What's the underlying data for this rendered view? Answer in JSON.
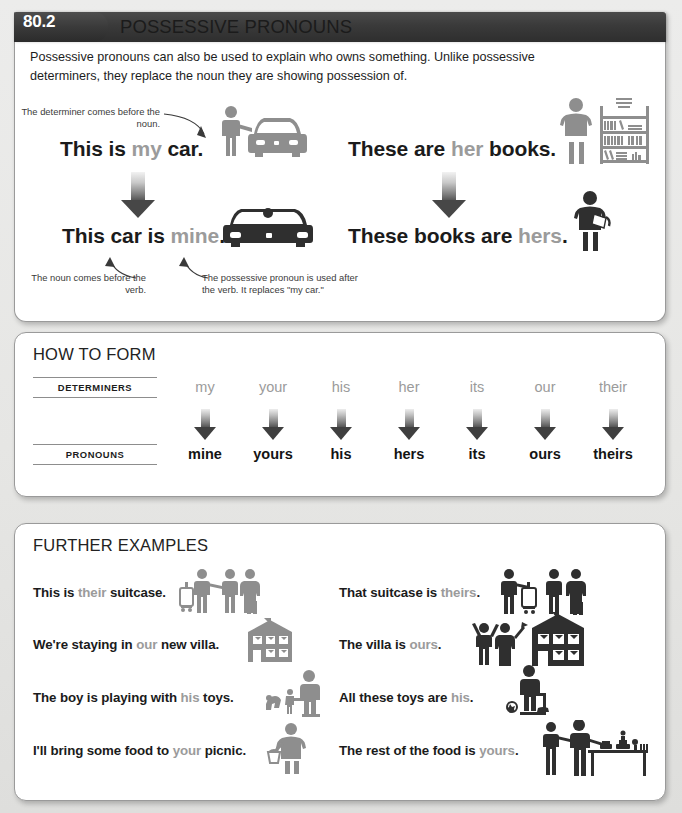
{
  "page": {
    "background_color": "#e9e9e7",
    "accent_gray": "#9b9b9b",
    "text_color": "#1b1b1b"
  },
  "header": {
    "badge": "80.2",
    "title": "POSSESSIVE PRONOUNS",
    "intro": "Possessive pronouns can also be used to explain who owns something. Unlike possessive determiners, they replace the noun they are showing possession of."
  },
  "main_examples": {
    "left": {
      "top_note": "The determiner comes before the noun.",
      "sentence_top": {
        "before": "This is ",
        "highlight": "my",
        "after": " car."
      },
      "sentence_bottom": {
        "before": "This car is ",
        "highlight": "mine",
        "after": "."
      },
      "note_left": "The noun comes before the verb.",
      "note_right": "The possessive pronoun is used after the verb. It replaces \"my car.\"",
      "icon_top": "person-with-car-icon",
      "icon_bottom": "car-icon"
    },
    "right": {
      "sentence_top": {
        "before": "These are ",
        "highlight": "her",
        "after": " books."
      },
      "sentence_bottom": {
        "before": "These books are ",
        "highlight": "hers",
        "after": "."
      },
      "icon_top": "woman-with-bookshelf-icon",
      "icon_bottom": "woman-holding-book-icon"
    }
  },
  "how_to_form": {
    "heading": "HOW TO FORM",
    "row_labels": [
      "DETERMINERS",
      "PRONOUNS"
    ],
    "determiners": [
      "my",
      "your",
      "his",
      "her",
      "its",
      "our",
      "their"
    ],
    "pronouns": [
      "mine",
      "yours",
      "his",
      "hers",
      "its",
      "ours",
      "theirs"
    ]
  },
  "further_examples": {
    "heading": "FURTHER EXAMPLES",
    "left_column": [
      {
        "before": "This is ",
        "highlight": "their",
        "after": " suitcase.",
        "icon": "people-with-suitcase-icon"
      },
      {
        "before": "We're staying in ",
        "highlight": "our",
        "after": " new villa.",
        "icon": "villa-icon"
      },
      {
        "before": "The boy is playing with ",
        "highlight": "his",
        "after": " toys.",
        "icon": "boy-with-toys-icon"
      },
      {
        "before": "I'll bring some food to ",
        "highlight": "your",
        "after": " picnic.",
        "icon": "woman-with-basket-icon"
      }
    ],
    "right_column": [
      {
        "before": "That suitcase is ",
        "highlight": "theirs",
        "after": ".",
        "icon": "people-with-suitcase-icon"
      },
      {
        "before": "The villa is ",
        "highlight": "ours",
        "after": ".",
        "icon": "couple-with-villa-icon"
      },
      {
        "before": "All these toys are ",
        "highlight": "his",
        "after": ".",
        "icon": "boy-with-toys-icon"
      },
      {
        "before": "The rest of the food is ",
        "highlight": "yours",
        "after": ".",
        "icon": "people-at-buffet-table-icon"
      }
    ]
  }
}
